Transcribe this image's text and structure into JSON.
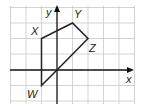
{
  "diagram": {
    "type": "coordinate-plane-polygon",
    "axes": {
      "x_label": "x",
      "y_label": "y"
    },
    "grid": {
      "x_range": [
        -3,
        5
      ],
      "y_range": [
        -2,
        4
      ],
      "unit_px": 15.5,
      "origin_px": [
        57,
        70
      ]
    },
    "points": [
      {
        "name": "W",
        "x": -1,
        "y": -1
      },
      {
        "name": "X",
        "x": -1,
        "y": 2
      },
      {
        "name": "Y",
        "x": 1,
        "y": 3
      },
      {
        "name": "Z",
        "x": 2,
        "y": 2
      },
      {
        "name": "O",
        "x": 0,
        "y": 0
      }
    ],
    "polygon": [
      "W",
      "X",
      "Y",
      "Z",
      "O"
    ],
    "labels": {
      "W": "W",
      "X": "X",
      "Y": "Y",
      "Z": "Z",
      "x": "x",
      "y": "y"
    },
    "colors": {
      "grid": "#c8c8c8",
      "axis": "#111111",
      "shape": "#222222"
    }
  }
}
